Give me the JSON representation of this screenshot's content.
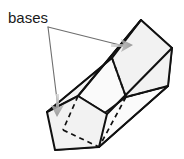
{
  "figure": {
    "kind": "geometry-diagram",
    "background_color": "#ffffff"
  },
  "labels": {
    "bases": "bases"
  },
  "colors": {
    "outline": "#111111",
    "hidden_edge": "#111111",
    "face_fill": "#f2f2f2",
    "face_fill_light": "#fafafa",
    "leader_line": "#6e6e6e",
    "arrow": "#8c8c8c",
    "text": "#1a1a1a"
  },
  "geometry": {
    "front_base_polygon": "47,112 78,96 107,114 99,147 55,150",
    "back_base_polygon": "112,58 141,20 172,48 168,86 126,97",
    "hidden_edges": [
      "112,58 126,97",
      "126,97 168,86",
      "126,97 99,147",
      "78,96 47,141"
    ],
    "visible_body_edges": [
      "47,112 112,58",
      "78,96 141,20",
      "107,114 172,48",
      "99,147 168,86",
      "55,150 126,97"
    ]
  },
  "annotations": {
    "leader_origin": {
      "x": 48,
      "y": 27
    },
    "arrow_to_back_base": {
      "tip_x": 133,
      "tip_y": 45,
      "angle_deg": 0
    },
    "arrow_to_front_base": {
      "tip_x": 57,
      "tip_y": 115,
      "angle_deg": 90
    }
  }
}
